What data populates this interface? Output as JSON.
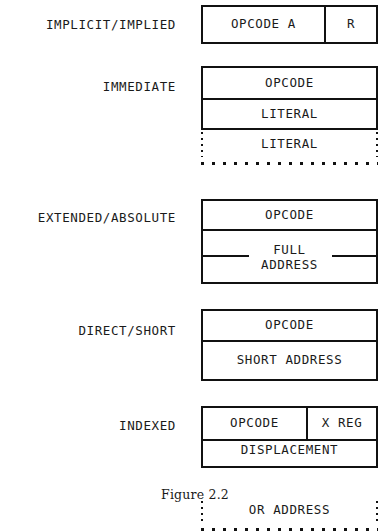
{
  "figure": {
    "caption": "Figure 2.2"
  },
  "modes": [
    {
      "label": "IMPLICIT/IMPLIED",
      "fields": [
        {
          "text": "OPCODE A",
          "style": "solid"
        },
        {
          "text": "R",
          "style": "solid"
        }
      ]
    },
    {
      "label": "IMMEDIATE",
      "fields": [
        {
          "text": "OPCODE",
          "style": "solid"
        },
        {
          "text": "LITERAL",
          "style": "solid"
        },
        {
          "text": "LITERAL",
          "style": "dotted"
        }
      ]
    },
    {
      "label": "EXTENDED/ABSOLUTE",
      "fields": [
        {
          "text": "OPCODE",
          "style": "solid"
        },
        {
          "line1": "FULL",
          "line2": "ADDRESS",
          "style": "solid-split"
        }
      ]
    },
    {
      "label": "DIRECT/SHORT",
      "fields": [
        {
          "text": "OPCODE",
          "style": "solid"
        },
        {
          "text": "SHORT ADDRESS",
          "style": "solid"
        }
      ]
    },
    {
      "label": "INDEXED",
      "fields": [
        {
          "text": "OPCODE",
          "style": "solid"
        },
        {
          "text": "X REG",
          "style": "solid"
        },
        {
          "text": "DISPLACEMENT",
          "style": "solid-split"
        },
        {
          "text": "OR ADDRESS",
          "style": "dotted"
        }
      ]
    }
  ],
  "colors": {
    "ink": "#1a1a1a",
    "rule": "#111111",
    "page": "#ffffff"
  }
}
